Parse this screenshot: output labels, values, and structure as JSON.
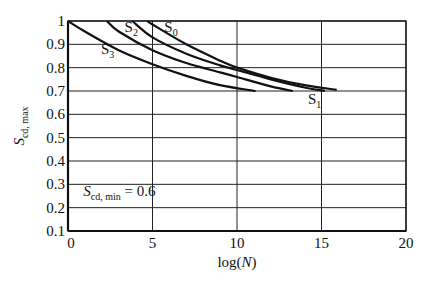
{
  "chart_data": {
    "type": "line",
    "title": "",
    "xlabel": "log(N)",
    "ylabel": "S_cd, max",
    "xlim": [
      0,
      20
    ],
    "ylim": [
      0.1,
      1.0
    ],
    "x_ticks": [
      0,
      5,
      10,
      15,
      20
    ],
    "y_ticks": [
      0.1,
      0.2,
      0.3,
      0.4,
      0.5,
      0.6,
      0.7,
      0.8,
      0.9,
      1
    ],
    "x_tick_labels": [
      "0",
      "5",
      "10",
      "15",
      "20"
    ],
    "y_tick_labels": [
      "0.1",
      "0.2",
      "0.3",
      "0.4",
      "0.5",
      "0.6",
      "0.7",
      "0.8",
      "0.9",
      "1"
    ],
    "grid": true,
    "annotation": {
      "text_main": "S",
      "text_sub": "cd, min",
      "text_value": " = 0.6",
      "x": 0.9,
      "y": 0.25
    },
    "series": [
      {
        "name": "S0",
        "label_main": "S",
        "label_sub": "0",
        "label_x": 5.7,
        "label_y": 0.955,
        "x": [
          4.7,
          5.0,
          7.0,
          9.0,
          10.0,
          12.0,
          14.0,
          15.9
        ],
        "y": [
          1.0,
          0.985,
          0.9,
          0.83,
          0.8,
          0.757,
          0.725,
          0.705
        ]
      },
      {
        "name": "S1",
        "label_main": "S",
        "label_sub": "1",
        "label_x": 14.2,
        "label_y": 0.645,
        "x": [
          3.8,
          5.0,
          7.0,
          9.0,
          10.0,
          12.0,
          14.0,
          15.2
        ],
        "y": [
          1.0,
          0.93,
          0.86,
          0.81,
          0.79,
          0.75,
          0.715,
          0.7
        ]
      },
      {
        "name": "S2",
        "label_main": "S",
        "label_sub": "2",
        "label_x": 3.35,
        "label_y": 0.955,
        "x": [
          2.3,
          3.0,
          5.0,
          7.0,
          9.0,
          10.0,
          12.0,
          13.3
        ],
        "y": [
          1.0,
          0.955,
          0.875,
          0.82,
          0.78,
          0.76,
          0.72,
          0.7
        ]
      },
      {
        "name": "S3",
        "label_main": "S",
        "label_sub": "3",
        "label_x": 1.95,
        "label_y": 0.86,
        "x": [
          0.0,
          1.0,
          3.0,
          5.0,
          7.0,
          9.0,
          11.1
        ],
        "y": [
          1.0,
          0.955,
          0.875,
          0.815,
          0.765,
          0.725,
          0.7
        ]
      }
    ]
  },
  "plot": {
    "left_px": 68,
    "top_px": 21,
    "right_px": 406,
    "bottom_px": 231,
    "line_color": "#111111",
    "grid_color": "#222222",
    "background": "#ffffff"
  }
}
